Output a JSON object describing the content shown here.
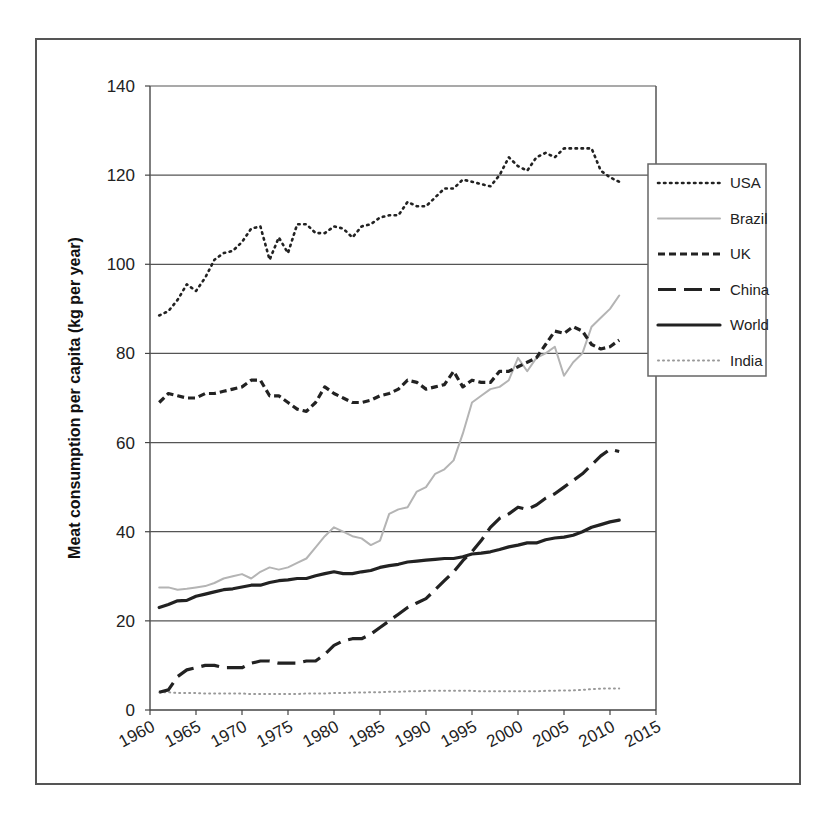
{
  "chart_data": {
    "type": "line",
    "title": "",
    "xlabel": "",
    "ylabel": "Meat consumption per capita (kg per year)",
    "xlim": [
      1960,
      2015
    ],
    "ylim": [
      0,
      140
    ],
    "x_ticks": [
      1960,
      1965,
      1970,
      1975,
      1980,
      1985,
      1990,
      1995,
      2000,
      2005,
      2010,
      2015
    ],
    "y_ticks": [
      0,
      20,
      40,
      60,
      80,
      100,
      120,
      140
    ],
    "grid": "horizontal",
    "legend_position": "right",
    "x": [
      1961,
      1962,
      1963,
      1964,
      1965,
      1966,
      1967,
      1968,
      1969,
      1970,
      1971,
      1972,
      1973,
      1974,
      1975,
      1976,
      1977,
      1978,
      1979,
      1980,
      1981,
      1982,
      1983,
      1984,
      1985,
      1986,
      1987,
      1988,
      1989,
      1990,
      1991,
      1992,
      1993,
      1994,
      1995,
      1996,
      1997,
      1998,
      1999,
      2000,
      2001,
      2002,
      2003,
      2004,
      2005,
      2006,
      2007,
      2008,
      2009,
      2010,
      2011
    ],
    "series": [
      {
        "name": "USA",
        "style": "dotted",
        "color": "#222222",
        "width": 2.6,
        "values": [
          88.5,
          89.5,
          92,
          95.5,
          94,
          97,
          101,
          102.5,
          103,
          105,
          108,
          108.5,
          101,
          106,
          102.5,
          109,
          109,
          107,
          107,
          108.5,
          108,
          106,
          108.5,
          109,
          110.5,
          111,
          111,
          114,
          113,
          113,
          115,
          117,
          117,
          119,
          118.5,
          118,
          117.5,
          120,
          124,
          122,
          121,
          124,
          125,
          124,
          126,
          126,
          126,
          126,
          121,
          119.5,
          118.5
        ]
      },
      {
        "name": "Brazil",
        "style": "solid",
        "color": "#b4b4b4",
        "width": 2,
        "values": [
          27.5,
          27.5,
          27,
          27.2,
          27.5,
          27.8,
          28.5,
          29.5,
          30,
          30.5,
          29.5,
          31,
          32,
          31.5,
          32,
          33,
          34,
          36.5,
          39,
          41,
          40,
          39,
          38.5,
          37,
          38,
          44,
          45,
          45.5,
          49,
          50,
          53,
          54,
          56,
          62,
          69,
          70.5,
          72,
          72.5,
          74,
          79,
          76,
          79,
          80,
          81.5,
          75,
          78,
          80,
          86,
          88,
          90,
          93
        ]
      },
      {
        "name": "UK",
        "style": "dashed",
        "color": "#222222",
        "width": 3.2,
        "values": [
          69,
          71,
          70.5,
          70,
          70,
          71,
          71,
          71.5,
          72,
          72.5,
          74,
          74,
          70.5,
          70.5,
          69,
          67.5,
          67,
          69,
          72.5,
          71,
          70,
          69,
          69,
          69.5,
          70.5,
          71,
          72,
          74,
          73.5,
          72,
          72.5,
          73,
          76,
          72.5,
          74,
          73.5,
          73.5,
          76,
          76,
          77,
          78,
          79,
          82,
          85,
          84.5,
          86,
          85,
          82,
          81,
          81.5,
          83
        ]
      },
      {
        "name": "China",
        "style": "longdash",
        "color": "#222222",
        "width": 3.2,
        "values": [
          4,
          4.5,
          7.5,
          9,
          9.5,
          10,
          10,
          9.5,
          9.5,
          9.5,
          10.5,
          11,
          11,
          10.5,
          10.5,
          10.5,
          11,
          11,
          12.5,
          14.5,
          15.5,
          16,
          16,
          17,
          18.5,
          20,
          21.5,
          23,
          24,
          25,
          27,
          29,
          31,
          33.5,
          35.5,
          38,
          41,
          43,
          44,
          45.5,
          45,
          46,
          47.5,
          48.5,
          50,
          51.5,
          53,
          55,
          57,
          58.5,
          58
        ]
      },
      {
        "name": "World",
        "style": "solid",
        "color": "#222222",
        "width": 3.2,
        "values": [
          23,
          23.7,
          24.5,
          24.6,
          25.5,
          26,
          26.5,
          27,
          27.2,
          27.6,
          28,
          28,
          28.6,
          29,
          29.2,
          29.5,
          29.5,
          30.1,
          30.6,
          31,
          30.6,
          30.6,
          31,
          31.3,
          32,
          32.4,
          32.7,
          33.2,
          33.4,
          33.6,
          33.8,
          34,
          34,
          34.4,
          35,
          35.2,
          35.5,
          36,
          36.6,
          37,
          37.5,
          37.5,
          38.2,
          38.6,
          38.8,
          39.2,
          40,
          41,
          41.6,
          42.2,
          42.6
        ]
      },
      {
        "name": "India",
        "style": "dotted-light",
        "color": "#999999",
        "width": 2,
        "values": [
          4,
          4,
          3.8,
          3.8,
          3.8,
          3.7,
          3.7,
          3.7,
          3.7,
          3.7,
          3.6,
          3.6,
          3.6,
          3.6,
          3.6,
          3.6,
          3.7,
          3.7,
          3.7,
          3.8,
          3.8,
          3.9,
          3.9,
          4,
          4,
          4.1,
          4.1,
          4.2,
          4.2,
          4.3,
          4.3,
          4.3,
          4.3,
          4.3,
          4.3,
          4.2,
          4.2,
          4.2,
          4.2,
          4.2,
          4.2,
          4.2,
          4.3,
          4.3,
          4.4,
          4.4,
          4.5,
          4.7,
          4.8,
          4.8,
          4.8
        ]
      }
    ]
  },
  "legend": {
    "items": [
      {
        "label": "USA"
      },
      {
        "label": "Brazil"
      },
      {
        "label": "UK"
      },
      {
        "label": "China"
      },
      {
        "label": "World"
      },
      {
        "label": "India"
      }
    ]
  }
}
